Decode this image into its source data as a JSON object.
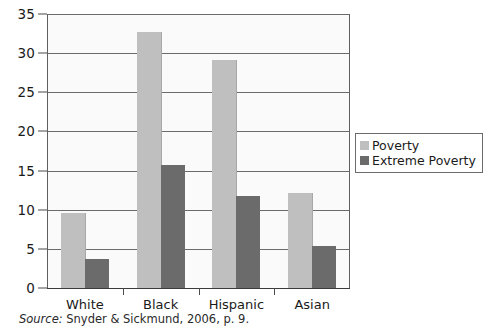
{
  "chart_data": {
    "type": "bar",
    "title": "",
    "subtitle": "",
    "xlabel": "",
    "ylabel": "",
    "ylim": [
      0,
      35
    ],
    "yticks": [
      0,
      5,
      10,
      15,
      20,
      25,
      30,
      35
    ],
    "ytick_labels": [
      "0",
      "5",
      "10",
      "15",
      "20",
      "25",
      "30",
      "35"
    ],
    "grid": true,
    "grid_axis": "y",
    "legend_position": "right",
    "categories": [
      "White",
      "Black",
      "Hispanic",
      "Asian"
    ],
    "series": [
      {
        "name": "Poverty",
        "color": "#bfbfbf",
        "values": [
          9.6,
          32.7,
          29.1,
          12.2
        ]
      },
      {
        "name": "Extreme Poverty",
        "color": "#6b6b6b",
        "values": [
          3.7,
          15.7,
          11.7,
          5.4
        ]
      }
    ]
  },
  "legend": {
    "items": [
      {
        "label": "Poverty",
        "swatch": "poverty"
      },
      {
        "label": "Extreme Poverty",
        "swatch": "extreme"
      }
    ]
  },
  "source": {
    "prefix": "Source:",
    "text": " Snyder & Sickmund, 2006, p. 9."
  }
}
